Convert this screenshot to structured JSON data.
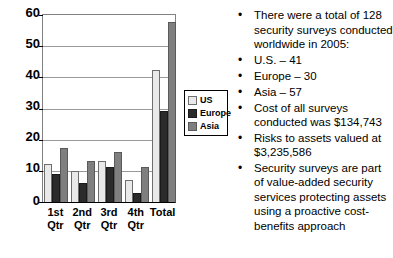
{
  "chart_data": {
    "type": "bar",
    "title": "",
    "xlabel": "",
    "ylabel": "",
    "grid": true,
    "legend_position": "right-inside",
    "ylim": [
      0,
      60
    ],
    "yticks": [
      0,
      10,
      20,
      30,
      40,
      50,
      60
    ],
    "categories": [
      "1st Qtr",
      "2nd Qtr",
      "3rd Qtr",
      "4th Qtr",
      "Total"
    ],
    "categories_lines": [
      [
        "1st",
        "Qtr"
      ],
      [
        "2nd",
        "Qtr"
      ],
      [
        "3rd",
        "Qtr"
      ],
      [
        "4th",
        "Qtr"
      ],
      [
        "Total",
        ""
      ]
    ],
    "series": [
      {
        "name": "US",
        "color": "#e9e9e9",
        "values": [
          12,
          10,
          13,
          7,
          42
        ]
      },
      {
        "name": "Europe",
        "color": "#2b2b2b",
        "values": [
          9,
          6,
          11,
          3,
          29
        ]
      },
      {
        "name": "Asia",
        "color": "#7f7f7f",
        "values": [
          17,
          13,
          16,
          11,
          57
        ]
      }
    ]
  },
  "legend": {
    "items": [
      {
        "label": "US"
      },
      {
        "label": "Europe"
      },
      {
        "label": "Asia"
      }
    ]
  },
  "axis": {
    "y_tick_labels": [
      "60",
      "50",
      "40",
      "30",
      "20",
      "10",
      "0"
    ]
  },
  "notes": {
    "bullet_char": "•",
    "items": [
      "There were a total of 128 security surveys conducted worldwide in 2005:",
      " U.S. – 41",
      "Europe – 30",
      "Asia – 57",
      "Cost of all surveys conducted was $134,743",
      "Risks to assets valued at $3,235,586",
      "Security surveys are part of value-added security services protecting assets using a proactive cost-benefits approach"
    ]
  }
}
